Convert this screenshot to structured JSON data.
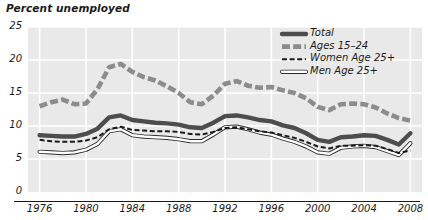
{
  "chart_data": {
    "type": "line",
    "title": "Percent unemployed",
    "xlabel": "",
    "ylabel": "Percent unemployed",
    "xlim": [
      1975,
      2009
    ],
    "ylim": [
      0,
      25
    ],
    "yticks": [
      "0",
      "5",
      "10",
      "15",
      "20",
      "25"
    ],
    "ytick_values": [
      0,
      5,
      10,
      15,
      20,
      25
    ],
    "xticks": [
      "1976",
      "1980",
      "1984",
      "1988",
      "1992",
      "1996",
      "2000",
      "2004",
      "2008"
    ],
    "xtick_values": [
      1976,
      1980,
      1984,
      1988,
      1992,
      1996,
      2000,
      2004,
      2008
    ],
    "grid": true,
    "legend_position": "top-right",
    "x": [
      1976,
      1977,
      1978,
      1979,
      1980,
      1981,
      1982,
      1983,
      1984,
      1985,
      1986,
      1987,
      1988,
      1989,
      1990,
      1991,
      1992,
      1993,
      1994,
      1995,
      1996,
      1997,
      1998,
      1999,
      2000,
      2001,
      2002,
      2003,
      2004,
      2005,
      2006,
      2007,
      2008
    ],
    "series": [
      {
        "name": "Total",
        "color": "#4d4d4d",
        "style": "thick-solid",
        "values": [
          8.6,
          8.5,
          8.4,
          8.4,
          8.8,
          9.6,
          11.3,
          11.6,
          10.9,
          10.7,
          10.5,
          10.4,
          10.2,
          9.8,
          9.7,
          10.5,
          11.5,
          11.6,
          11.3,
          10.9,
          10.7,
          10.1,
          9.7,
          8.9,
          7.9,
          7.6,
          8.3,
          8.4,
          8.6,
          8.5,
          7.9,
          7.2,
          8.9
        ]
      },
      {
        "name": "Ages 15–24",
        "color": "#8c8c8c",
        "style": "thick-dashed",
        "values": [
          13.0,
          13.6,
          14.0,
          13.3,
          13.4,
          15.6,
          18.9,
          19.4,
          18.2,
          17.4,
          16.9,
          16.0,
          15.0,
          13.6,
          13.3,
          14.6,
          16.4,
          16.8,
          16.1,
          15.8,
          15.9,
          15.4,
          15.0,
          14.2,
          12.9,
          12.4,
          13.3,
          13.4,
          13.3,
          12.8,
          11.9,
          11.2,
          10.8
        ]
      },
      {
        "name": "Women Age 25+",
        "color": "#1a1a1a",
        "style": "thin-dashed",
        "values": [
          7.9,
          7.7,
          7.6,
          7.6,
          7.8,
          8.3,
          9.5,
          9.9,
          9.4,
          9.3,
          9.2,
          9.2,
          9.1,
          8.8,
          8.7,
          9.1,
          9.7,
          9.8,
          9.5,
          9.2,
          9.0,
          8.6,
          8.2,
          7.6,
          6.9,
          6.6,
          7.0,
          7.0,
          7.1,
          7.0,
          6.5,
          5.9,
          6.3
        ]
      },
      {
        "name": "Men Age 25+",
        "color": "#ffffff",
        "style": "thin-outline",
        "values": [
          6.1,
          6.0,
          5.9,
          6.0,
          6.4,
          7.3,
          9.2,
          9.5,
          8.6,
          8.4,
          8.3,
          8.2,
          8.0,
          7.7,
          7.7,
          8.7,
          9.8,
          9.9,
          9.5,
          9.0,
          8.7,
          8.1,
          7.6,
          6.9,
          6.0,
          5.8,
          6.7,
          6.9,
          7.0,
          6.8,
          6.2,
          5.6,
          7.4
        ]
      }
    ],
    "legend": [
      {
        "label": "Total",
        "color": "#4d4d4d",
        "style": "thick-solid"
      },
      {
        "label": "Ages 15–24",
        "color": "#8c8c8c",
        "style": "thick-dashed"
      },
      {
        "label": "Women Age 25+",
        "color": "#1a1a1a",
        "style": "thin-dashed"
      },
      {
        "label": "Men Age 25+",
        "color": "#ffffff",
        "style": "thin-outline"
      }
    ]
  }
}
